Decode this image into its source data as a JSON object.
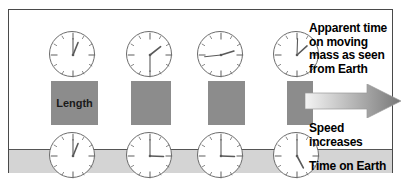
{
  "figure": {
    "border_color": "#4a4a4a",
    "background": "#ffffff",
    "ground_color": "#d4d4d4",
    "bar_color": "#8c8c8c",
    "clock_face_color": "#ffffff",
    "clock_rim_color": "#6c6c6c"
  },
  "labels": {
    "apparent_time": "Apparent time on moving mass as seen from Earth",
    "apparent_time_lines": [
      "Apparent time",
      "on moving",
      "mass as seen",
      "from Earth"
    ],
    "speed": "Speed increases",
    "speed_lines": [
      "Speed",
      "increases"
    ],
    "time_on_earth": "Time on Earth",
    "length": "Length"
  },
  "arrow": {
    "name": "speed-increase-arrow",
    "direction": "right",
    "gradient_from": "#f2f2f2",
    "gradient_to": "#7b7b7b"
  },
  "columns": [
    {
      "index": 1,
      "speed_label": "rest",
      "bar": {
        "x": 42,
        "y": 71,
        "width": 47,
        "height": 44
      },
      "top_clock": {
        "cx": 63,
        "cy": 44,
        "r": 23,
        "hour_deg": 22,
        "minute_deg": 0
      },
      "bottom_clock": {
        "cx": 63,
        "cy": 145,
        "r": 23,
        "hour_deg": 22,
        "minute_deg": 0
      }
    },
    {
      "index": 2,
      "speed_label": "moderate",
      "bar": {
        "x": 122,
        "y": 71,
        "width": 40,
        "height": 44
      },
      "top_clock": {
        "cx": 140,
        "cy": 44,
        "r": 23,
        "hour_deg": 52,
        "minute_deg": 180
      },
      "bottom_clock": {
        "cx": 140,
        "cy": 145,
        "r": 23,
        "hour_deg": 92,
        "minute_deg": 0
      }
    },
    {
      "index": 3,
      "speed_label": "fast",
      "bar": {
        "x": 199,
        "y": 71,
        "width": 37,
        "height": 44
      },
      "top_clock": {
        "cx": 211,
        "cy": 44,
        "r": 23,
        "hour_deg": 73,
        "minute_deg": 264
      },
      "bottom_clock": {
        "cx": 211,
        "cy": 145,
        "r": 23,
        "hour_deg": 92,
        "minute_deg": 0
      }
    },
    {
      "index": 4,
      "speed_label": "near light speed",
      "bar": {
        "x": 278,
        "y": 71,
        "width": 26,
        "height": 44
      },
      "top_clock": {
        "cx": 287,
        "cy": 44,
        "r": 23,
        "hour_deg": 48,
        "minute_deg": 2
      },
      "bottom_clock": {
        "cx": 287,
        "cy": 145,
        "r": 23,
        "hour_deg": 152,
        "minute_deg": 0
      }
    }
  ],
  "chart_data": {
    "type": "diagram",
    "concept": "Relativistic time dilation and length contraction increase with speed",
    "x": [
      "rest",
      "moderate",
      "fast",
      "near light speed"
    ],
    "series": [
      {
        "name": "Length (bar width, px)",
        "values": [
          47,
          40,
          37,
          26
        ]
      },
      {
        "name": "Apparent clock hour-hand angle (deg)",
        "values": [
          22,
          52,
          73,
          48
        ]
      },
      {
        "name": "Earth clock hour-hand angle (deg)",
        "values": [
          22,
          92,
          92,
          152
        ]
      }
    ],
    "annotations": [
      "Length",
      "Speed increases",
      "Time on Earth",
      "Apparent time on moving mass as seen from Earth"
    ],
    "grid": false,
    "legend": "none"
  }
}
